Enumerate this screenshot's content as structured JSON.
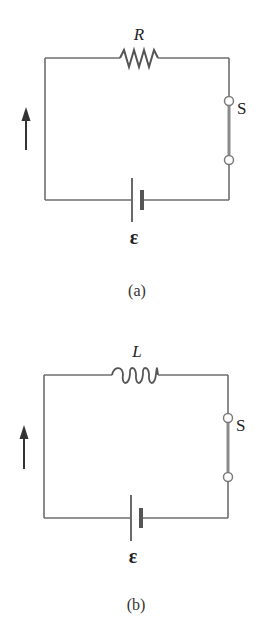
{
  "figure": {
    "panels": [
      {
        "id": "a",
        "caption": "(a)",
        "component": "resistor",
        "component_label": "R",
        "switch_label": "S",
        "emf_label": "ε",
        "current_arrow": "up"
      },
      {
        "id": "b",
        "caption": "(b)",
        "component": "inductor",
        "component_label": "L",
        "switch_label": "S",
        "emf_label": "ε",
        "current_arrow": "up"
      }
    ],
    "colors": {
      "wire": "#6e6e6e",
      "arrow": "#333333",
      "text": "#222222",
      "background": "#ffffff"
    }
  }
}
